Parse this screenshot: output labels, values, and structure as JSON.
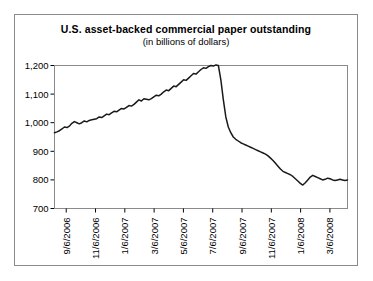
{
  "chart_data": {
    "type": "line",
    "title": "U.S. asset-backed commercial paper outstanding",
    "subtitle": "(in billions of dollars)",
    "xlabel": "",
    "ylabel": "",
    "ylim": [
      700,
      1200
    ],
    "yticks": [
      700,
      800,
      900,
      1000,
      1100,
      1200
    ],
    "ytick_labels": [
      "700",
      "800",
      "900",
      "1,000",
      "1,100",
      "1,200"
    ],
    "grid": false,
    "legend": null,
    "xtick_labels": [
      "9/6/2006",
      "11/6/2006",
      "1/6/2007",
      "3/6/2007",
      "5/6/2007",
      "7/6/2007",
      "9/6/2007",
      "11/6/2007",
      "1/6/2008",
      "3/6/2008"
    ],
    "x_start": "9/6/2006",
    "x_end": "3/6/2008",
    "series": [
      {
        "name": "ABCP outstanding",
        "values": [
          965,
          968,
          972,
          978,
          985,
          983,
          988,
          998,
          1004,
          1000,
          996,
          1000,
          1006,
          1003,
          1008,
          1010,
          1012,
          1014,
          1020,
          1018,
          1024,
          1030,
          1028,
          1034,
          1040,
          1038,
          1044,
          1050,
          1048,
          1054,
          1060,
          1058,
          1064,
          1072,
          1080,
          1076,
          1084,
          1082,
          1080,
          1084,
          1090,
          1096,
          1094,
          1100,
          1108,
          1114,
          1112,
          1120,
          1128,
          1126,
          1134,
          1142,
          1150,
          1148,
          1156,
          1164,
          1172,
          1170,
          1178,
          1186,
          1192,
          1190,
          1196,
          1200,
          1198,
          1202,
          1200,
          1150,
          1080,
          1020,
          985,
          965,
          950,
          942,
          936,
          930,
          926,
          922,
          918,
          914,
          910,
          906,
          902,
          898,
          894,
          890,
          884,
          876,
          868,
          858,
          848,
          838,
          830,
          826,
          822,
          818,
          812,
          804,
          796,
          788,
          782,
          790,
          800,
          810,
          816,
          812,
          808,
          804,
          800,
          802,
          806,
          804,
          800,
          798,
          800,
          802,
          800,
          798,
          800
        ]
      }
    ]
  }
}
